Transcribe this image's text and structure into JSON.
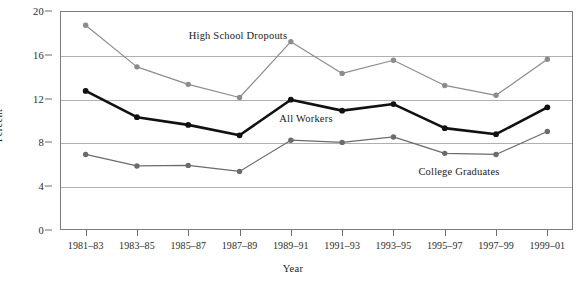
{
  "chart_data": {
    "type": "line",
    "title": "",
    "xlabel": "Year",
    "ylabel": "Percent",
    "ylim": [
      0,
      20
    ],
    "yticks": [
      0,
      4,
      8,
      12,
      16,
      20
    ],
    "grid": true,
    "legend_position": "inline-annotations",
    "categories": [
      "1981–83",
      "1983–85",
      "1985–87",
      "1987–89",
      "1989–91",
      "1991–93",
      "1993–95",
      "1995–97",
      "1997–99",
      "1999–01"
    ],
    "series": [
      {
        "name": "High School Dropouts",
        "color": "#8c8c8c",
        "values": [
          18.7,
          14.9,
          13.3,
          12.1,
          17.2,
          14.3,
          15.5,
          13.2,
          12.3,
          15.6
        ]
      },
      {
        "name": "All Workers",
        "color": "#111111",
        "values": [
          12.7,
          10.3,
          9.6,
          8.65,
          11.9,
          10.9,
          11.5,
          9.3,
          8.75,
          11.2
        ]
      },
      {
        "name": "College Graduates",
        "color": "#6b6b6b",
        "values": [
          6.9,
          5.85,
          5.9,
          5.35,
          8.2,
          8.0,
          8.5,
          7.0,
          6.9,
          9.0
        ]
      }
    ],
    "annotations": [
      {
        "text": "High School Dropouts",
        "x_px": 238,
        "y_px": 35
      },
      {
        "text": "All Workers",
        "x_px": 306,
        "y_px": 118
      },
      {
        "text": "College Graduates",
        "x_px": 459,
        "y_px": 171
      }
    ]
  },
  "axis": {
    "y_tick_labels": [
      "20",
      "16",
      "12",
      "8",
      "4",
      "0"
    ],
    "y_title": "Percent",
    "x_title": "Year"
  }
}
